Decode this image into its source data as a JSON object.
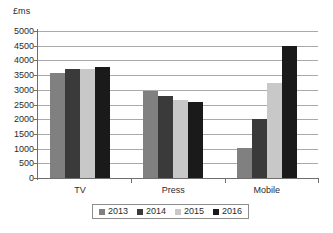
{
  "chart_data": {
    "type": "bar",
    "title": "",
    "subtitle": "",
    "xlabel": "",
    "ylabel": "£ms",
    "categories": [
      "TV",
      "Press",
      "Mobile"
    ],
    "series": [
      {
        "name": "2013",
        "color": "#808080",
        "values": [
          3580,
          2950,
          1030
        ]
      },
      {
        "name": "2014",
        "color": "#3a3a3a",
        "values": [
          3700,
          2790,
          2020
        ]
      },
      {
        "name": "2015",
        "color": "#c8c8c8",
        "values": [
          3720,
          2670,
          3220
        ]
      },
      {
        "name": "2016",
        "color": "#1a1a1a",
        "values": [
          3790,
          2570,
          4480
        ]
      }
    ],
    "ylim": [
      0,
      5000
    ],
    "ytick_step": 500,
    "yticks": [
      0,
      500,
      1000,
      1500,
      2000,
      2500,
      3000,
      3500,
      4000,
      4500,
      5000
    ],
    "ytick_labels": [
      "0",
      "500",
      "1000",
      "1500",
      "2000",
      "2500",
      "3000",
      "3500",
      "4000",
      "4500",
      "5000"
    ],
    "grid": true,
    "grid_axis": "y",
    "legend_position": "bottom",
    "legend_entries": [
      "2013",
      "2014",
      "2015",
      "2016"
    ]
  },
  "axis": {
    "unit_label": "£ms"
  },
  "legend": {
    "items": [
      {
        "label": "2013"
      },
      {
        "label": "2014"
      },
      {
        "label": "2015"
      },
      {
        "label": "2016"
      }
    ]
  },
  "caption": {
    "text": ""
  },
  "colors": {
    "series_2013": "#808080",
    "series_2014": "#3a3a3a",
    "series_2015": "#c8c8c8",
    "series_2016": "#1a1a1a",
    "gridline": "#a9a9a9",
    "axis": "#6e6e6e",
    "text": "#2b2b2b",
    "background": "#ffffff"
  }
}
